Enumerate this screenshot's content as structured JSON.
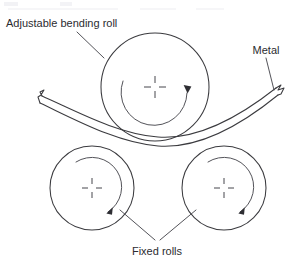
{
  "diagram": {
    "background_color": "#ffffff",
    "line_color": "#3b3b3f",
    "text_color": "#2b2b30",
    "width": 292,
    "height": 266,
    "labels": {
      "adjustable_bending_roll": "Adjustable bending roll",
      "metal": "Metal",
      "fixed_rolls": "Fixed rolls"
    },
    "top_artifact": {
      "visible_text": ""
    },
    "parts": [
      {
        "name": "adjustable-bending-roll",
        "label": "Adjustable bending roll",
        "shape": "circle",
        "center_x": 155,
        "center_y": 87,
        "radius": 54,
        "rotation": "clockwise",
        "has_center_crosshair": true
      },
      {
        "name": "fixed-roll-left",
        "label": "Fixed rolls",
        "shape": "circle",
        "center_x": 92,
        "center_y": 188,
        "radius": 42,
        "rotation": "clockwise",
        "has_center_crosshair": true
      },
      {
        "name": "fixed-roll-right",
        "label": "Fixed rolls",
        "shape": "circle",
        "center_x": 224,
        "center_y": 188,
        "radius": 42,
        "rotation": "clockwise",
        "has_center_crosshair": true
      },
      {
        "name": "metal-sheet",
        "label": "Metal",
        "shape": "curved-strip",
        "description": "Sheet metal strip bent downward between the adjustable roll above and the two fixed rolls below, with torn ends at both sides"
      }
    ],
    "leaders": [
      {
        "name": "leader-adjustable-bending-roll",
        "from_label": "Adjustable bending roll",
        "to_part": "adjustable-bending-roll"
      },
      {
        "name": "leader-metal",
        "from_label": "Metal",
        "to_part": "metal-sheet"
      },
      {
        "name": "leader-fixed-roll-left",
        "from_label": "Fixed rolls",
        "to_part": "fixed-roll-left"
      },
      {
        "name": "leader-fixed-roll-right",
        "from_label": "Fixed rolls",
        "to_part": "fixed-roll-right"
      }
    ]
  }
}
